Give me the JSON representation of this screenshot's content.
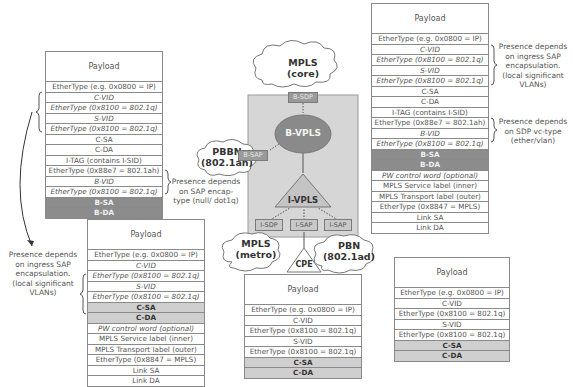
{
  "diagram": {
    "center": {
      "clouds": [
        {
          "name": "mpls-core",
          "label": "MPLS\n(core)"
        },
        {
          "name": "pbbn",
          "label": "PBBN\n(802.1ah)"
        },
        {
          "name": "mpls-metro",
          "label": "MPLS\n(metro)"
        },
        {
          "name": "pbn",
          "label": "PBN\n(802.1ad)"
        }
      ],
      "b_sdp": "B-SDP",
      "b_sap": "B-SAP",
      "b_vpls": "B-VPLS",
      "i_vpls": "I-VPLS",
      "i_sdp": "I-SDP",
      "i_sap_1": "I-SAP",
      "i_sap_2": "I-SAP",
      "cpe": "CPE"
    },
    "stacks": {
      "top_left": {
        "rows": [
          {
            "text": "Payload",
            "style": "payload"
          },
          {
            "text": "EtherType (e.g. 0x0800 = IP)",
            "style": "normal"
          },
          {
            "text": "C-VID",
            "style": "italic"
          },
          {
            "text": "EtherType (0x8100 = 802.1q)",
            "style": "italic"
          },
          {
            "text": "S-VID",
            "style": "italic"
          },
          {
            "text": "EtherType (0x8100 = 802.1q)",
            "style": "italic"
          },
          {
            "text": "C-SA",
            "style": "normal"
          },
          {
            "text": "C-DA",
            "style": "normal"
          },
          {
            "text": "I-TAG (contains I-SID)",
            "style": "normal"
          },
          {
            "text": "EtherType (0x88e7 = 802.1ah)",
            "style": "normal"
          },
          {
            "text": "B-VID",
            "style": "italic"
          },
          {
            "text": "EtherType (0x8100 = 802.1q)",
            "style": "italic"
          },
          {
            "text": "B-SA",
            "style": "dark"
          },
          {
            "text": "B-DA",
            "style": "dark"
          }
        ]
      },
      "top_right": {
        "rows": [
          {
            "text": "Payload",
            "style": "payload"
          },
          {
            "text": "EtherType (e.g. 0x0800 = IP)",
            "style": "normal"
          },
          {
            "text": "C-VID",
            "style": "italic"
          },
          {
            "text": "EtherType (0x8100 = 802.1q)",
            "style": "italic"
          },
          {
            "text": "S-VID",
            "style": "italic"
          },
          {
            "text": "EtherType (0x8100 = 802.1q)",
            "style": "italic"
          },
          {
            "text": "C-SA",
            "style": "normal"
          },
          {
            "text": "C-DA",
            "style": "normal"
          },
          {
            "text": "I-TAG (contains I-SID)",
            "style": "normal"
          },
          {
            "text": "EtherType (0x88e7 = 802.1ah)",
            "style": "normal"
          },
          {
            "text": "B-VID",
            "style": "italic"
          },
          {
            "text": "EtherType (0x8100 = 802.1q)",
            "style": "italic"
          },
          {
            "text": "B-SA",
            "style": "dark"
          },
          {
            "text": "B-DA",
            "style": "dark"
          },
          {
            "text": "PW control word (optional)",
            "style": "italic"
          },
          {
            "text": "MPLS Service label (inner)",
            "style": "normal"
          },
          {
            "text": "MPLS Transport label (outer)",
            "style": "normal"
          },
          {
            "text": "EtherType (0x8847 = MPLS)",
            "style": "normal"
          },
          {
            "text": "Link SA",
            "style": "normal"
          },
          {
            "text": "Link DA",
            "style": "normal"
          }
        ]
      },
      "bottom_left": {
        "rows": [
          {
            "text": "Payload",
            "style": "payload"
          },
          {
            "text": "EtherType (e.g. 0x0800 = IP)",
            "style": "normal"
          },
          {
            "text": "C-VID",
            "style": "italic"
          },
          {
            "text": "EtherType (0x8100 = 802.1q)",
            "style": "italic"
          },
          {
            "text": "S-VID",
            "style": "italic"
          },
          {
            "text": "EtherType (0x8100 = 802.1q)",
            "style": "italic"
          },
          {
            "text": "C-SA",
            "style": "light"
          },
          {
            "text": "C-DA",
            "style": "light"
          },
          {
            "text": "PW control word (optional)",
            "style": "italic"
          },
          {
            "text": "MPLS Service label (inner)",
            "style": "normal"
          },
          {
            "text": "MPLS Transport label (outer)",
            "style": "normal"
          },
          {
            "text": "EtherType (0x8847 = MPLS)",
            "style": "normal"
          },
          {
            "text": "Link SA",
            "style": "normal"
          },
          {
            "text": "Link DA",
            "style": "normal"
          }
        ]
      },
      "bottom_center": {
        "rows": [
          {
            "text": "Payload",
            "style": "payload"
          },
          {
            "text": "EtherType (e.g. 0x0800 = IP)",
            "style": "normal"
          },
          {
            "text": "C-VID",
            "style": "normal"
          },
          {
            "text": "EtherType (0x8100 = 802.1q)",
            "style": "normal"
          },
          {
            "text": "S-VID",
            "style": "normal"
          },
          {
            "text": "EtherType (0x8100 = 802.1q)",
            "style": "normal"
          },
          {
            "text": "C-SA",
            "style": "light"
          },
          {
            "text": "C-DA",
            "style": "light"
          }
        ]
      },
      "bottom_right": {
        "rows": [
          {
            "text": "Payload",
            "style": "payload"
          },
          {
            "text": "EtherType (e.g. 0x0800 = IP)",
            "style": "normal"
          },
          {
            "text": "C-VID",
            "style": "normal"
          },
          {
            "text": "EtherType (0x8100 = 802.1q)",
            "style": "normal"
          },
          {
            "text": "S-VID",
            "style": "normal"
          },
          {
            "text": "EtherType (0x8100 = 802.1q)",
            "style": "normal"
          },
          {
            "text": "C-SA",
            "style": "light"
          },
          {
            "text": "C-DA",
            "style": "light"
          }
        ]
      }
    },
    "notes": {
      "top_left_sap": "Presence depends\non SAP encap-\ntype (null/ dot1q)",
      "top_right_ingress": "Presence depends\non ingress SAP\nencapsulation.\n(local significant\nVLANs)",
      "top_right_sdp": "Presence depends\non SDP vc-type\n(ether/vlan)",
      "bottom_left_ingress": "Presence depends\non ingress SAP\nencapsulation.\n(local significant\nVLANs)"
    },
    "colors": {
      "dark_row": "#8c8c8c",
      "light_row": "#cfcfcf",
      "center_box": "#d6d6d6",
      "oval": "#8a8a8a",
      "triangle": "#c4c4c4",
      "border": "#8a8a8a"
    }
  }
}
